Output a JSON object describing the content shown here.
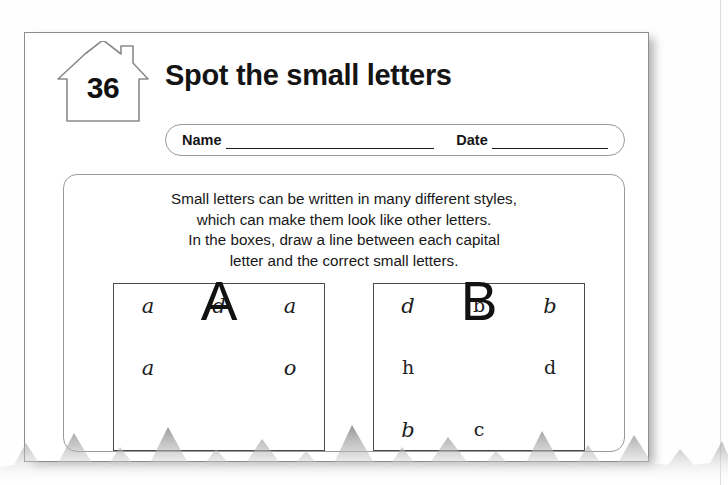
{
  "worksheet": {
    "page_number": "36",
    "title": "Spot the small letters",
    "house_icon": "house-icon"
  },
  "name_date": {
    "name_label": "Name",
    "date_label": "Date",
    "name_value": "",
    "date_value": "",
    "name_placeholder": "",
    "date_placeholder": ""
  },
  "instructions": {
    "line1": "Small letters can be written in many different styles,",
    "line2": "which can make them look like other letters.",
    "line3": "In the boxes, draw a line between each capital",
    "line4": "letter and the correct small letters."
  },
  "exercises": [
    {
      "name": "exercise-box-a",
      "capital": "A",
      "rows": [
        {
          "left": "a",
          "right": "d",
          "far_right": "a"
        },
        {
          "left": "a",
          "right": "",
          "far_right": "o"
        },
        {
          "left": "",
          "right": "",
          "far_right": ""
        }
      ]
    },
    {
      "name": "exercise-box-b",
      "capital": "B",
      "rows": [
        {
          "left": "d",
          "right": "b",
          "far_right": "b"
        },
        {
          "left": "h",
          "right": "",
          "far_right": "d"
        },
        {
          "left": "b",
          "right": "c",
          "far_right": ""
        }
      ]
    }
  ],
  "colors": {
    "ink": "#1a1a1a",
    "rule": "#8d8d8d",
    "paper": "#ffffff",
    "torn_edge": "#a8a8a8"
  }
}
